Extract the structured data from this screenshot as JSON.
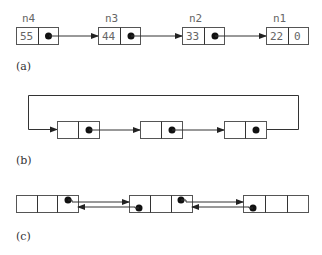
{
  "diagram": {
    "type": "linked-list-figure",
    "panels": [
      {
        "caption": "(a)",
        "kind": "singly-linked-list",
        "nodes": [
          {
            "name": "n4",
            "value": "55",
            "next": "n3"
          },
          {
            "name": "n3",
            "value": "44",
            "next": "n2"
          },
          {
            "name": "n2",
            "value": "33",
            "next": "n1"
          },
          {
            "name": "n1",
            "value": "22",
            "next_text": "0"
          }
        ]
      },
      {
        "caption": "(b)",
        "kind": "circular-linked-list",
        "nodes": [
          {},
          {},
          {}
        ]
      },
      {
        "caption": "(c)",
        "kind": "doubly-linked-list",
        "nodes": [
          {},
          {},
          {}
        ]
      }
    ],
    "colors": {
      "stroke": "#555555",
      "line": "#333333",
      "text": "#666666",
      "dot": "#111111"
    }
  }
}
